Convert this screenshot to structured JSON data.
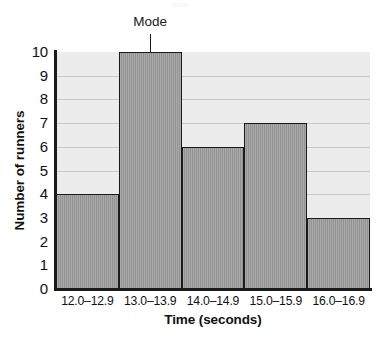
{
  "chart_data": {
    "type": "bar",
    "title": "",
    "subtitle": "",
    "categories": [
      "12.0–12.9",
      "13.0–13.9",
      "14.0–14.9",
      "15.0–15.9",
      "16.0–16.9"
    ],
    "values": [
      4,
      10,
      6,
      7,
      3
    ],
    "xlabel": "Time (seconds)",
    "ylabel": "Number of runners",
    "ylim": [
      0,
      10
    ],
    "yticks": [
      "10",
      "9",
      "8",
      "7",
      "6",
      "5",
      "4",
      "3",
      "2",
      "1",
      "0"
    ],
    "ytick_values": [
      10,
      9,
      8,
      7,
      6,
      5,
      4,
      3,
      2,
      1,
      0
    ],
    "grid": true,
    "grid_axis": "y",
    "legend": null,
    "annotations": [
      {
        "text": "Mode",
        "points_to_category": "13.0–13.9",
        "points_to_value": 10,
        "style": "leader-line"
      }
    ],
    "colors": {
      "bar_fill": "#9a9a9a",
      "bar_edge": "#1a1a1a",
      "plot_background": "#ececec",
      "gridline": "#c9c9c9",
      "axis": "#1a1a1a",
      "text": "#111111",
      "figure_background": "#ffffff"
    }
  },
  "page_artifact": {
    "text": "Mode"
  }
}
